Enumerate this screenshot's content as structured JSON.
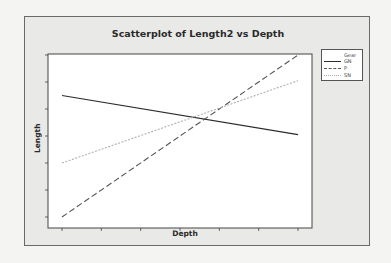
{
  "chart_data": {
    "type": "line",
    "title": "Scatterplot of Length2 vs Depth",
    "xlabel": "Depth",
    "ylabel": "Length",
    "x_tick_count": 7,
    "y_tick_count": 7,
    "x_tick_labels": [],
    "y_tick_labels": [],
    "xlim": [
      0,
      6
    ],
    "ylim": [
      0,
      6
    ],
    "grid": false,
    "legend_position": "right-top",
    "legend_title": "Gear",
    "series": [
      {
        "name": "GN",
        "style": "solid",
        "color": "#2b2b2b",
        "x": [
          0,
          6
        ],
        "y": [
          4.5,
          3.05
        ]
      },
      {
        "name": "P",
        "style": "dashed",
        "color": "#555555",
        "x": [
          0,
          6
        ],
        "y": [
          0.0,
          6.0
        ]
      },
      {
        "name": "SN",
        "style": "dotted",
        "color": "#b0b0b0",
        "x": [
          0,
          6
        ],
        "y": [
          2.0,
          5.05
        ]
      }
    ]
  },
  "legend": {
    "title": "Gear",
    "items": [
      {
        "label": "GN"
      },
      {
        "label": "P"
      },
      {
        "label": "SN"
      }
    ]
  }
}
